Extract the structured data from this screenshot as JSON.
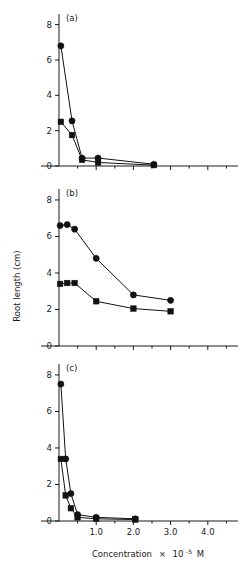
{
  "figure": {
    "axis_titles": {
      "y": "Root length (cm)",
      "x_prefix": "Concentration",
      "x_times": "×",
      "x_base": "10",
      "x_exp": "-5",
      "x_unit": "M",
      "x_full": "Concentration × 10-5 M"
    },
    "panel_labels": {
      "a": "(a)",
      "b": "(b)",
      "c": "(c)"
    },
    "y_ticks": [
      "0",
      "2",
      "4",
      "6",
      "8"
    ],
    "x_ticks": [
      "1.0",
      "2.0",
      "3.0",
      "4.0"
    ]
  },
  "chart_data": [
    {
      "type": "line",
      "panel": "(a)",
      "title": "",
      "xlabel": "Concentration × 10-5 M",
      "ylabel": "Root length (cm)",
      "xlim": [
        0,
        4.6
      ],
      "ylim": [
        0,
        8.6
      ],
      "yticks": [
        0,
        2,
        4,
        6,
        8
      ],
      "xticks": [
        1.0,
        2.0,
        3.0,
        4.0
      ],
      "minor_xticks": [
        0.5,
        1.5,
        2.5,
        3.5,
        4.5
      ],
      "grid": false,
      "legend": "none",
      "series": [
        {
          "name": "circle-series",
          "marker": "circle",
          "x": [
            0.05,
            0.35,
            0.62,
            1.05,
            2.55
          ],
          "values": [
            6.8,
            2.55,
            0.45,
            0.45,
            0.1
          ]
        },
        {
          "name": "square-series",
          "marker": "square",
          "x": [
            0.05,
            0.35,
            0.62,
            1.05,
            2.55
          ],
          "values": [
            2.5,
            1.75,
            0.35,
            0.2,
            0.05
          ]
        }
      ]
    },
    {
      "type": "line",
      "panel": "(b)",
      "title": "",
      "xlabel": "Concentration × 10-5 M",
      "ylabel": "Root length (cm)",
      "xlim": [
        0,
        4.6
      ],
      "ylim": [
        0,
        8.6
      ],
      "yticks": [
        0,
        2,
        4,
        6,
        8
      ],
      "xticks": [
        1.0,
        2.0,
        3.0,
        4.0
      ],
      "minor_xticks": [
        0.5,
        1.5,
        2.5,
        3.5,
        4.5
      ],
      "grid": false,
      "legend": "none",
      "series": [
        {
          "name": "circle-series",
          "marker": "circle",
          "x": [
            0.03,
            0.22,
            0.42,
            1.0,
            2.0,
            3.0
          ],
          "values": [
            6.6,
            6.65,
            6.4,
            4.8,
            2.8,
            2.5
          ]
        },
        {
          "name": "square-series",
          "marker": "square",
          "x": [
            0.03,
            0.22,
            0.42,
            1.0,
            2.0,
            3.0
          ],
          "values": [
            3.4,
            3.45,
            3.45,
            2.45,
            2.05,
            1.9
          ]
        }
      ]
    },
    {
      "type": "line",
      "panel": "(c)",
      "title": "",
      "xlabel": "Concentration × 10-5 M",
      "ylabel": "Root length (cm)",
      "xlim": [
        0,
        4.6
      ],
      "ylim": [
        0,
        8.6
      ],
      "yticks": [
        0,
        2,
        4,
        6,
        8
      ],
      "xticks": [
        1.0,
        2.0,
        3.0,
        4.0
      ],
      "minor_xticks": [
        0.5,
        1.5,
        2.5,
        3.5,
        4.5
      ],
      "grid": false,
      "legend": "none",
      "series": [
        {
          "name": "circle-series",
          "marker": "circle",
          "x": [
            0.05,
            0.18,
            0.32,
            0.5,
            1.0,
            2.05
          ],
          "values": [
            7.5,
            3.4,
            1.5,
            0.35,
            0.2,
            0.12
          ]
        },
        {
          "name": "square-series",
          "marker": "square",
          "x": [
            0.05,
            0.18,
            0.32,
            0.5,
            1.0,
            2.05
          ],
          "values": [
            3.4,
            1.4,
            0.7,
            0.2,
            0.12,
            0.08
          ]
        }
      ]
    }
  ]
}
